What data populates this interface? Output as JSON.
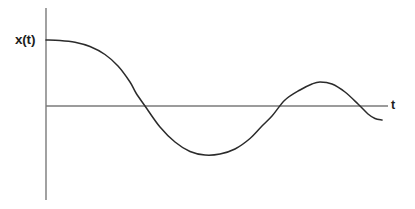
{
  "figure": {
    "background_color": "#ffffff",
    "width": 415,
    "height": 209,
    "y_axis_label": "x(t)",
    "x_axis_label": "t"
  },
  "chart_data": {
    "type": "line",
    "title": "",
    "xlabel": "t",
    "ylabel": "x(t)",
    "grid": false,
    "legend": "none",
    "axis_color": "#7a7a7a",
    "curve_color": "#2b2b2b",
    "x_axis": {
      "start_px": 46,
      "end_px": 388,
      "baseline_px": 106,
      "ticks": [],
      "tick_labels": []
    },
    "y_axis": {
      "top_px": 8,
      "bottom_px": 200,
      "position_px": 46,
      "ticks": [],
      "tick_labels": []
    },
    "features": {
      "initial_value_px": 40,
      "zero_crossings_px": [
        136,
        272,
        358
      ],
      "minimum_px": [
        205,
        155
      ],
      "local_maximum_px": [
        320,
        82
      ],
      "end_point_px": [
        382,
        120
      ]
    },
    "x": [
      46,
      60,
      75,
      90,
      105,
      118,
      130,
      136,
      145,
      160,
      175,
      190,
      205,
      220,
      235,
      250,
      262,
      272,
      285,
      300,
      312,
      320,
      332,
      345,
      358,
      368,
      375,
      382
    ],
    "y": [
      40,
      40.4,
      42.2,
      46.5,
      54.5,
      66,
      82,
      93,
      106,
      127,
      142,
      151.5,
      155,
      154,
      149,
      138.5,
      126,
      116,
      100,
      90,
      84,
      82,
      84,
      92,
      104,
      114,
      118.5,
      120
    ],
    "values_normalized": [
      1.0,
      0.99,
      0.96,
      0.9,
      0.78,
      0.6,
      0.36,
      0.2,
      0.0,
      -0.32,
      -0.55,
      -0.69,
      -0.74,
      -0.73,
      -0.65,
      -0.49,
      -0.3,
      -0.15,
      0.09,
      0.24,
      0.33,
      0.36,
      0.33,
      0.21,
      0.03,
      -0.12,
      -0.19,
      -0.21
    ]
  }
}
